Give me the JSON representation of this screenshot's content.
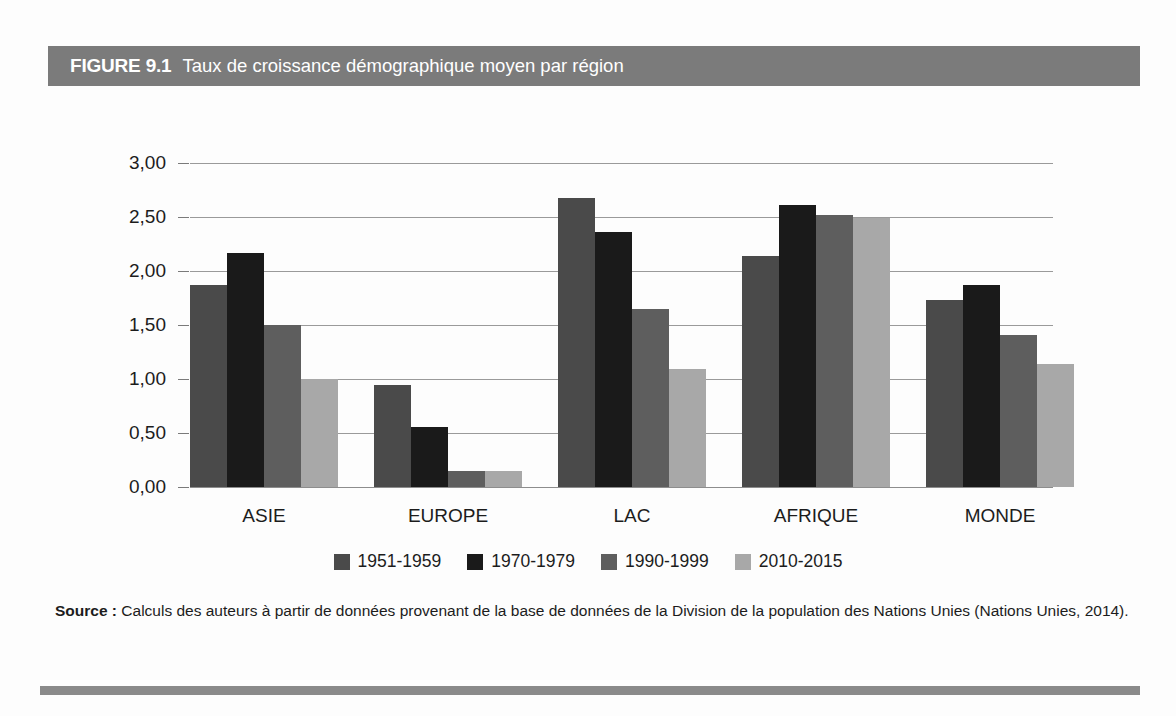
{
  "figure": {
    "number": "FIGURE 9.1",
    "title": "Taux de croissance démographique moyen par région",
    "header_bg": "#7b7b7b",
    "rule_color": "#8a8a8a"
  },
  "source": {
    "label": "Source :",
    "text": " Calculs des auteurs à partir de données provenant de la base de données de la Division de la population des Nations Unies (Nations Unies, 2014)."
  },
  "chart_data": {
    "type": "bar",
    "title": "Taux de croissance démographique moyen par région",
    "xlabel": "",
    "ylabel": "",
    "ylim": [
      0,
      3.0
    ],
    "yticks": [
      0,
      0.5,
      1.0,
      1.5,
      2.0,
      2.5,
      3.0
    ],
    "ytick_labels": [
      "0,00",
      "0,50",
      "1,00",
      "1,50",
      "2,00",
      "2,50",
      "3,00"
    ],
    "grid": true,
    "legend_position": "bottom",
    "categories": [
      "ASIE",
      "EUROPE",
      "LAC",
      "AFRIQUE",
      "MONDE"
    ],
    "series": [
      {
        "name": "1951-1959",
        "color": "#4a4a4a",
        "values": [
          1.87,
          0.94,
          2.68,
          2.14,
          1.73
        ]
      },
      {
        "name": "1970-1979",
        "color": "#1a1a1a",
        "values": [
          2.17,
          0.56,
          2.36,
          2.61,
          1.87
        ]
      },
      {
        "name": "1990-1999",
        "color": "#5e5e5e",
        "values": [
          1.5,
          0.15,
          1.65,
          2.52,
          1.41
        ]
      },
      {
        "name": "2010-2015",
        "color": "#a8a8a8",
        "values": [
          1.0,
          0.15,
          1.09,
          2.49,
          1.14
        ]
      }
    ]
  }
}
